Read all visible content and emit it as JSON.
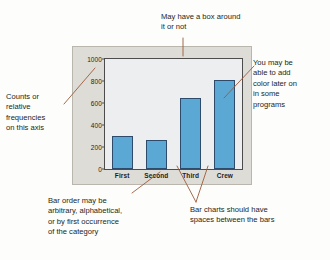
{
  "figure": {
    "annotations": [
      {
        "name": "box-note",
        "text": "May have a box around\nit or not"
      },
      {
        "name": "counts-note",
        "text": "Counts or\nrelative\nfrequencies\non this axis"
      },
      {
        "name": "color-note",
        "text": "You may be\nable to add\ncolor later on\nin some\nprograms"
      },
      {
        "name": "order-note",
        "text": "Bar order may be\narbitrary, alphabetical,\nor by first occurrence\nof the category"
      },
      {
        "name": "spaces-note",
        "text": "Bar charts should have\nspaces between the bars"
      }
    ],
    "colors": {
      "bar_fill": "#5ba8d4",
      "bar_edge": "#2e4b6b",
      "frame_band": "#dedcd6",
      "plot_background": "#eceef0",
      "axis": "#4c4c4c",
      "leader_line": "#9c5a3c",
      "text": "#231f20"
    }
  },
  "chart_data": {
    "type": "bar",
    "title": "",
    "xlabel": "",
    "ylabel": "",
    "categories": [
      "First",
      "Second",
      "Third",
      "Crew"
    ],
    "values": [
      300,
      260,
      645,
      810
    ],
    "ylim": [
      0,
      1000
    ],
    "yticks": [
      0,
      200,
      400,
      600,
      800,
      1000
    ],
    "ytick_labels": [
      "0",
      "200",
      "400",
      "600",
      "800",
      "1000"
    ],
    "grid": false,
    "legend": null,
    "bar_gap": true
  }
}
